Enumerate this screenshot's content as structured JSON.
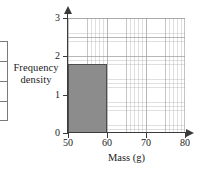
{
  "chart_data": {
    "type": "bar",
    "title": "",
    "xlabel": "Mass (g)",
    "ylabel": "Frequency density",
    "ylabel_lines": [
      "Frequency",
      "density"
    ],
    "xlim": [
      50,
      80
    ],
    "ylim": [
      0,
      3
    ],
    "x_ticks": [
      "50",
      "60",
      "70",
      "80"
    ],
    "x_tick_values": [
      50,
      60,
      70,
      80
    ],
    "y_ticks": [
      "0",
      "1",
      "2",
      "3"
    ],
    "y_tick_values": [
      0,
      1,
      2,
      3
    ],
    "grid": true,
    "grid_minor": true,
    "legend": "none",
    "bars": [
      {
        "x_start": 50,
        "x_end": 60,
        "frequency_density": 1.8,
        "frequency": 18,
        "fill_color": "#8c8c8c",
        "edge_color": "#4d4d4d"
      }
    ],
    "axis_color": "#3a3a3a",
    "grid_major_color": "#969696",
    "grid_minor_color": "#b9b9b9"
  },
  "side_table": {
    "visible_rows": 4,
    "note": ""
  },
  "icons": {
    "y_axis_arrow": "arrow-up-icon",
    "x_axis_arrow": "arrow-right-icon"
  }
}
